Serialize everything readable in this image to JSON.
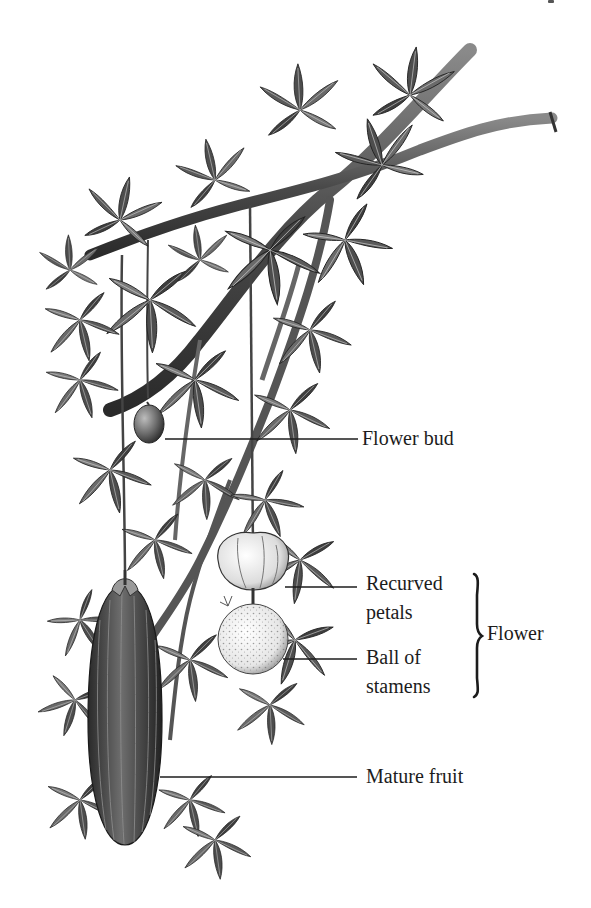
{
  "figure": {
    "background_color": "#ffffff",
    "ink_color": "#1c1c1c"
  },
  "labels": {
    "flower_bud": {
      "text": "Flower bud"
    },
    "recurved_petals": {
      "line1": "Recurved",
      "line2": "petals"
    },
    "ball_of_stamens": {
      "line1": "Ball of",
      "line2": "stamens"
    },
    "flower_group": {
      "text": "Flower"
    },
    "mature_fruit": {
      "text": "Mature fruit"
    }
  }
}
